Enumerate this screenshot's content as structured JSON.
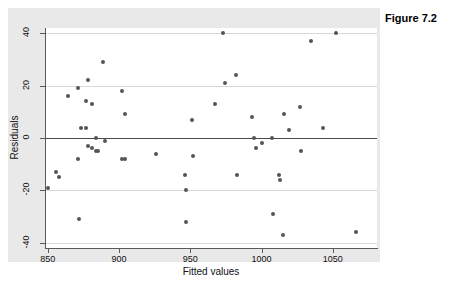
{
  "figure": {
    "title": "Figure 7.2",
    "background_color": "#e9e9e9",
    "plot_background_color": "#ffffff",
    "marker_color": "#555555",
    "gridline_color": "#d8d8d8",
    "zeroline_color": "#4a4a4a"
  },
  "chart_data": {
    "type": "scatter",
    "title": "Figure 7.2",
    "xlabel": "Fitted values",
    "ylabel": "Residuals",
    "xlim": [
      848,
      1081
    ],
    "ylim": [
      -42,
      42
    ],
    "xticks": [
      850,
      900,
      950,
      1000,
      1050
    ],
    "yticks": [
      -40,
      -20,
      0,
      20,
      40
    ],
    "xtick_labels": [
      "850",
      "900",
      "950",
      "1000",
      "1050"
    ],
    "ytick_labels": [
      "-40",
      "-20",
      "0",
      "20",
      "40"
    ],
    "grid": "horizontal",
    "gridlines_at": [
      40,
      20,
      -20,
      -40
    ],
    "reference_line": 0,
    "legend": "none",
    "points": [
      {
        "x": 850,
        "y": -19
      },
      {
        "x": 856,
        "y": -13
      },
      {
        "x": 858,
        "y": -15
      },
      {
        "x": 864,
        "y": 16
      },
      {
        "x": 871,
        "y": 19
      },
      {
        "x": 871,
        "y": -8
      },
      {
        "x": 872,
        "y": -31
      },
      {
        "x": 873,
        "y": 4
      },
      {
        "x": 877,
        "y": 14
      },
      {
        "x": 877,
        "y": 4
      },
      {
        "x": 878,
        "y": 22
      },
      {
        "x": 878,
        "y": -3
      },
      {
        "x": 881,
        "y": 13
      },
      {
        "x": 881,
        "y": -4
      },
      {
        "x": 884,
        "y": 0
      },
      {
        "x": 884,
        "y": -5
      },
      {
        "x": 885,
        "y": -5
      },
      {
        "x": 889,
        "y": 29
      },
      {
        "x": 890,
        "y": -1
      },
      {
        "x": 902,
        "y": 18
      },
      {
        "x": 902,
        "y": -8
      },
      {
        "x": 904,
        "y": 9
      },
      {
        "x": 904,
        "y": -8
      },
      {
        "x": 926,
        "y": -6
      },
      {
        "x": 946,
        "y": -14
      },
      {
        "x": 947,
        "y": -20
      },
      {
        "x": 947,
        "y": -32
      },
      {
        "x": 951,
        "y": 7
      },
      {
        "x": 952,
        "y": -7
      },
      {
        "x": 967,
        "y": 13
      },
      {
        "x": 973,
        "y": 40
      },
      {
        "x": 974,
        "y": 21
      },
      {
        "x": 982,
        "y": 24
      },
      {
        "x": 983,
        "y": -14
      },
      {
        "x": 993,
        "y": 8
      },
      {
        "x": 995,
        "y": 0
      },
      {
        "x": 996,
        "y": -4
      },
      {
        "x": 1000,
        "y": -2
      },
      {
        "x": 1007,
        "y": 0
      },
      {
        "x": 1008,
        "y": -29
      },
      {
        "x": 1012,
        "y": -14
      },
      {
        "x": 1013,
        "y": -16
      },
      {
        "x": 1015,
        "y": -37
      },
      {
        "x": 1016,
        "y": 9
      },
      {
        "x": 1019,
        "y": 3
      },
      {
        "x": 1027,
        "y": 12
      },
      {
        "x": 1028,
        "y": -5
      },
      {
        "x": 1035,
        "y": 37
      },
      {
        "x": 1043,
        "y": 4
      },
      {
        "x": 1052,
        "y": 40
      },
      {
        "x": 1066,
        "y": -36
      }
    ]
  }
}
